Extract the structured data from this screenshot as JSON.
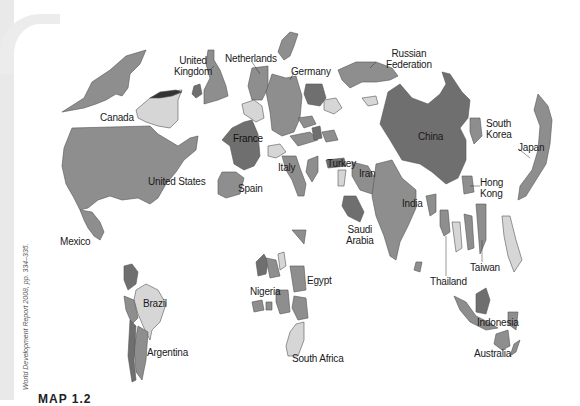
{
  "figure": {
    "caption": "MAP 1.2",
    "source_credit": "World Development Report 2008, pp. 334–335.",
    "map_type": "cartogram"
  },
  "colors": {
    "background": "#ffffff",
    "margin": "#e9e9e9",
    "dark": "#6f6f6f",
    "mid": "#8e8e8e",
    "light": "#d6d6d6",
    "outline": "#555555"
  },
  "labels": {
    "united_states": "United States",
    "canada": "Canada",
    "mexico": "Mexico",
    "united_kingdom": [
      "United",
      "Kingdom"
    ],
    "netherlands": "Netherlands",
    "germany": "Germany",
    "france": "France",
    "spain": "Spain",
    "italy": "Italy",
    "turkey": "Turkey",
    "russian_federation": [
      "Russian",
      "Federation"
    ],
    "iran": "Iran",
    "saudi_arabia": [
      "Saudi",
      "Arabia"
    ],
    "india": "India",
    "china": "China",
    "south_korea": [
      "South",
      "Korea"
    ],
    "japan": "Japan",
    "hong_kong": [
      "Hong",
      "Kong"
    ],
    "taiwan": "Taiwan",
    "thailand": "Thailand",
    "indonesia": "Indonesia",
    "australia": "Australia",
    "brazil": "Brazil",
    "argentina": "Argentina",
    "nigeria": "Nigeria",
    "egypt": "Egypt",
    "south_africa": "South Africa"
  }
}
